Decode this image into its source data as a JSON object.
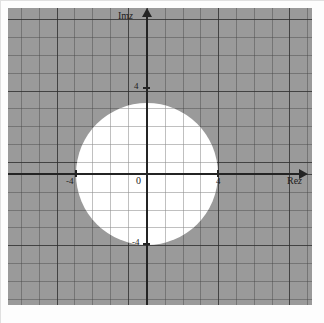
{
  "figure": {
    "kind": "complex-plane-region-diagram"
  },
  "axes": {
    "real_axis_label": "Re z",
    "imag_axis_label": "Im z",
    "real_axis_label_parts": {
      "prefix": "Re",
      "variable": "z"
    },
    "imag_axis_label_parts": {
      "prefix": "Im",
      "variable": "z"
    },
    "origin_label": "0"
  },
  "ticks": {
    "real_negative": "-4",
    "real_positive": "4",
    "imag_positive": "4",
    "imag_negative": "-4"
  },
  "chart_data": {
    "type": "scatter",
    "title": "",
    "xlabel": "Re z",
    "ylabel": "Im z",
    "xlim": [
      -7.8,
      8.6
    ],
    "ylim": [
      -7.4,
      9.3
    ],
    "xticks": [
      -4,
      0,
      4
    ],
    "yticks": [
      -4,
      0,
      4
    ],
    "xtick_labels": [
      "-4",
      "0",
      "4"
    ],
    "ytick_labels": [
      "-4",
      "0",
      "4"
    ],
    "grid": true,
    "grid_minor_step": 1,
    "grid_major_step": 4,
    "legend": "none",
    "shapes": [
      {
        "name": "unshaded-disk",
        "type": "circle",
        "center": [
          0,
          0
        ],
        "radius": 4,
        "fill": "#ffffff",
        "meaning": "|z| < 4"
      },
      {
        "name": "shaded-exterior",
        "type": "region",
        "fill": "#9a9a9a",
        "meaning": "|z| >= 4"
      }
    ]
  },
  "colors": {
    "shaded_region": "#9a9a9a",
    "unshaded_region": "#ffffff",
    "axis": "#242424",
    "grid_minor": "#6e6e6e",
    "grid_major": "#4a4a4a",
    "text": "#1d1d1d"
  }
}
